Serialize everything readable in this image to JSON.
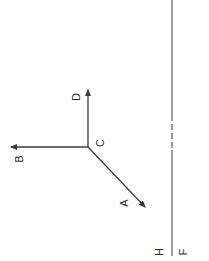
{
  "diagram": {
    "colors": {
      "line": "#3a3a3a",
      "text": "#2a2a2a",
      "background": "#ffffff"
    },
    "origin": {
      "label": "C",
      "x": 88,
      "y": 147
    },
    "vectors": [
      {
        "id": "D",
        "label": "D",
        "from": [
          88,
          147
        ],
        "to": [
          88,
          88
        ],
        "label_pos": [
          77,
          97
        ]
      },
      {
        "id": "B",
        "label": "B",
        "from": [
          88,
          147
        ],
        "to": [
          9,
          147
        ],
        "label_pos": [
          20,
          159
        ]
      },
      {
        "id": "A",
        "label": "A",
        "from": [
          88,
          147
        ],
        "to": [
          147,
          209
        ],
        "label_pos": [
          125,
          203
        ]
      }
    ],
    "origin_label_pos": [
      101,
      143
    ],
    "boundary_line": {
      "x": 172,
      "y_top": 0,
      "y_bottom": 256,
      "dashed_segment": [
        115,
        150
      ],
      "left_label": "H",
      "right_label": "F",
      "left_label_pos": [
        160,
        252
      ],
      "right_label_pos": [
        184,
        252
      ]
    },
    "labels": {
      "A": "A",
      "B": "B",
      "C": "C",
      "D": "D",
      "H": "H",
      "F": "F"
    },
    "text_rotation_deg": -90
  }
}
